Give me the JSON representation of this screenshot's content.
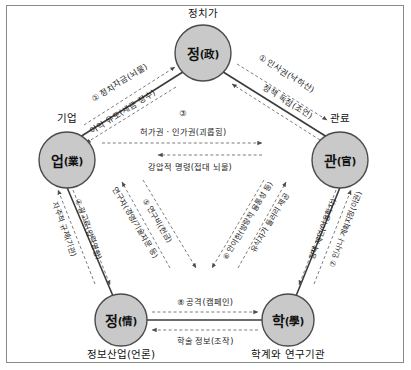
{
  "diagram": {
    "title_visible": false,
    "colors": {
      "node_fill": "#c9c9c9",
      "node_stroke": "#4a4a4a",
      "solid_edge": "#3b3b3b",
      "dashed_edge": "#6d6d6d",
      "frame": "#8a8a8a",
      "background": "#ffffff",
      "text": "#111111"
    },
    "nodes": [
      {
        "id": "politics",
        "hanja_label": "정(政)",
        "main": "정",
        "paren": "(政)",
        "outer_label": "정치가",
        "outer_position": "above"
      },
      {
        "id": "business",
        "hanja_label": "업(業)",
        "main": "업",
        "paren": "(業)",
        "outer_label": "기업",
        "outer_position": "above-left"
      },
      {
        "id": "bureaucracy",
        "hanja_label": "관(官)",
        "main": "관",
        "paren": "(官)",
        "outer_label": "관료",
        "outer_position": "above-right"
      },
      {
        "id": "information",
        "hanja_label": "정(情)",
        "main": "정",
        "paren": "(情)",
        "outer_label": "정보산업(언론)",
        "outer_position": "below"
      },
      {
        "id": "academia",
        "hanja_label": "학(學)",
        "main": "학",
        "paren": "(學)",
        "outer_label": "학계와 연구기관",
        "outer_position": "below"
      }
    ],
    "edges": [
      {
        "number": "①",
        "label": "인사권(낙하산)",
        "from": "politics",
        "to": "bureaucracy",
        "style": "dashed"
      },
      {
        "number": "",
        "label": "정책 독점(조언)",
        "from": "bureaucracy",
        "to": "politics",
        "style": "dashed"
      },
      {
        "number": "②",
        "label": "정치자금(뇌물)",
        "from": "business",
        "to": "politics",
        "style": "dashed"
      },
      {
        "number": "",
        "label": "이익 유도(세금 징수)",
        "from": "politics",
        "to": "business",
        "style": "dashed"
      },
      {
        "number": "③",
        "label": "허가권 · 인가권(괴롭힘)",
        "from": "business",
        "to": "bureaucracy",
        "style": "dashed"
      },
      {
        "number": "",
        "label": "강압적 명령(접대 뇌물)",
        "from": "bureaucracy",
        "to": "business",
        "style": "dashed"
      },
      {
        "number": "④",
        "label": "광고료(압력영향)",
        "from": "business",
        "to": "information",
        "style": "dashed"
      },
      {
        "number": "",
        "label": "자주적 규제(기관)",
        "from": "information",
        "to": "business",
        "style": "dashed"
      },
      {
        "number": "⑤",
        "label": "연구비(헌금)",
        "from": "business",
        "to": "academia",
        "style": "dashed"
      },
      {
        "number": "",
        "label": "연구자(경영/기술자문 등)",
        "from": "academia",
        "to": "business",
        "style": "dashed"
      },
      {
        "number": "⑥",
        "label": "안이한(방랑적 융통성 등)",
        "from": "bureaucracy",
        "to": "information",
        "style": "dashed"
      },
      {
        "number": "",
        "label": "유식자가 들러리 제공",
        "from": "information",
        "to": "bureaucracy",
        "style": "dashed"
      },
      {
        "number": "⑦",
        "label": "인사나 계획지정(이권)",
        "from": "bureaucracy",
        "to": "academia",
        "style": "dashed"
      },
      {
        "number": "",
        "label": "정책 제언(어용학자)",
        "from": "academia",
        "to": "bureaucracy",
        "style": "dashed"
      },
      {
        "number": "⑧",
        "label": "공격(캠페인)",
        "from": "information",
        "to": "academia",
        "style": "dashed"
      },
      {
        "number": "",
        "label": "학술 정보(조작)",
        "from": "academia",
        "to": "information",
        "style": "dashed"
      }
    ]
  }
}
